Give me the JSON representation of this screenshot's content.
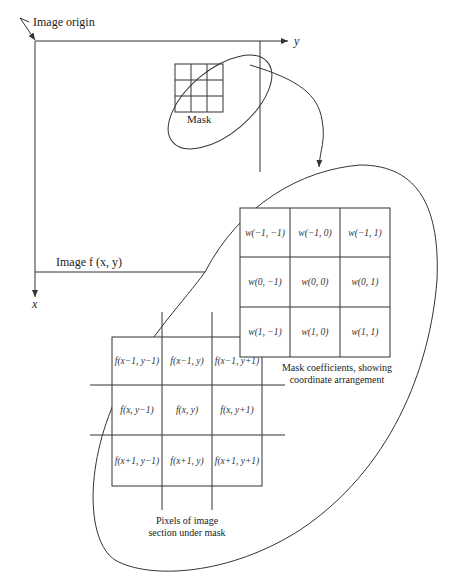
{
  "labels": {
    "image_origin": "Image origin",
    "y_axis": "y",
    "x_axis": "x",
    "mask": "Mask",
    "image_fxy": "Image f (x, y)"
  },
  "mask_coefficients": {
    "rows": [
      [
        "w(−1, −1)",
        "w(−1, 0)",
        "w(−1, 1)"
      ],
      [
        "w(0, −1)",
        "w(0, 0)",
        "w(0, 1)"
      ],
      [
        "w(1, −1)",
        "w(1, 0)",
        "w(1, 1)"
      ]
    ],
    "caption_line1": "Mask coefficients, showing",
    "caption_line2": "coordinate arrangement"
  },
  "image_pixels": {
    "rows": [
      [
        "f(x−1, y−1)",
        "f(x−1, y)",
        "f(x−1, y+1)"
      ],
      [
        "f(x, y−1)",
        "f(x, y)",
        "f(x, y+1)"
      ],
      [
        "f(x+1, y−1)",
        "f(x+1, y)",
        "f(x+1, y+1)"
      ]
    ],
    "caption_line1": "Pixels of image",
    "caption_line2": "section under mask"
  },
  "colors": {
    "line": "#333333",
    "background": "#ffffff"
  }
}
